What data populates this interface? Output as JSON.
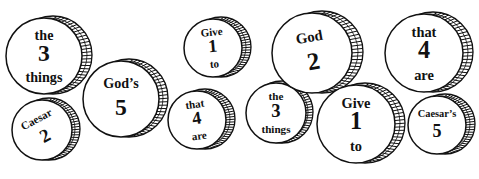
{
  "puzzle": {
    "description": "Coin word puzzle",
    "ink_color": "#111111",
    "background": "#ffffff",
    "coins": [
      {
        "id": "coin-the-3-things-left",
        "cx": 44,
        "cy": 56,
        "r": 38,
        "rim": 9,
        "top": "the",
        "number": "3",
        "bottom": "things",
        "rotate": 0
      },
      {
        "id": "coin-caesar-2",
        "cx": 42,
        "cy": 130,
        "r": 30,
        "rim": 7,
        "top": "Caesar",
        "number": "2",
        "bottom": "",
        "rotate": -28
      },
      {
        "id": "coin-gods-5",
        "cx": 121,
        "cy": 99,
        "r": 38,
        "rim": 8,
        "top": "God’s",
        "number": "5",
        "bottom": "",
        "rotate": 0
      },
      {
        "id": "coin-give-1-to-small",
        "cx": 213,
        "cy": 48,
        "r": 29,
        "rim": 8,
        "top": "Give",
        "number": "1",
        "bottom": "to",
        "rotate": -5
      },
      {
        "id": "coin-that-4-are-small",
        "cx": 197,
        "cy": 120,
        "r": 29,
        "rim": 8,
        "top": "that",
        "number": "4",
        "bottom": "are",
        "rotate": -8
      },
      {
        "id": "coin-the-3-things-right",
        "cx": 276,
        "cy": 113,
        "r": 30,
        "rim": 6,
        "top": "the",
        "number": "3",
        "bottom": "things",
        "rotate": 0
      },
      {
        "id": "coin-god-2",
        "cx": 312,
        "cy": 53,
        "r": 40,
        "rim": 10,
        "top": "God",
        "number": "2",
        "bottom": "",
        "rotate": -10
      },
      {
        "id": "coin-give-1-to-large",
        "cx": 356,
        "cy": 124,
        "r": 39,
        "rim": 9,
        "top": "Give",
        "number": "1",
        "bottom": "to",
        "rotate": 0
      },
      {
        "id": "coin-that-4-are-large",
        "cx": 424,
        "cy": 53,
        "r": 39,
        "rim": 9,
        "top": "that",
        "number": "4",
        "bottom": "are",
        "rotate": 0
      },
      {
        "id": "coin-caesars-5",
        "cx": 437,
        "cy": 125,
        "r": 29,
        "rim": 8,
        "top": "Caesar’s",
        "number": "5",
        "bottom": "",
        "rotate": 0
      }
    ]
  }
}
